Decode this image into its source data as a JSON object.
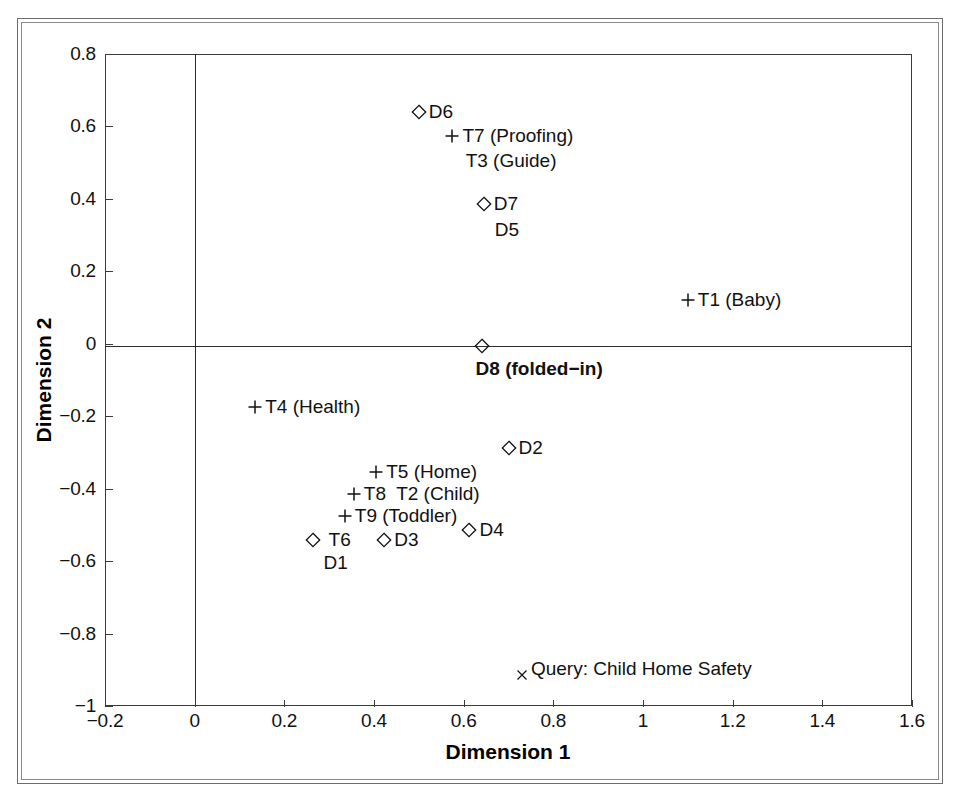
{
  "chart_data": {
    "type": "scatter",
    "title": "",
    "xlabel": "Dimension 1",
    "ylabel": "Dimension 2",
    "xlim": [
      -0.2,
      1.6
    ],
    "ylim": [
      -1.0,
      0.8
    ],
    "xticks": [
      "-0.2",
      "0",
      "0.2",
      "0.4",
      "0.6",
      "0.8",
      "1",
      "1.2",
      "1.4",
      "1.6"
    ],
    "xtickvalues": [
      -0.2,
      0,
      0.2,
      0.4,
      0.6,
      0.8,
      1.0,
      1.2,
      1.4,
      1.6
    ],
    "yticks": [
      "0.8",
      "0.6",
      "0.4",
      "0.2",
      "0",
      "-0.2",
      "-0.4",
      "-0.6",
      "-0.8",
      "-1"
    ],
    "ytickvalues": [
      0.8,
      0.6,
      0.4,
      0.2,
      0,
      -0.2,
      -0.4,
      -0.6,
      -0.8,
      -1.0
    ],
    "grid": false,
    "legend": "none",
    "axes_at_origin": true,
    "marker_kinds": {
      "diamond": "document",
      "plus": "term",
      "cross": "query"
    },
    "points": [
      {
        "id": "p-d6",
        "marker": "diamond",
        "x": 0.5,
        "y": 0.64,
        "label": "D6",
        "label_pos": "right",
        "bold": false
      },
      {
        "id": "p-t7",
        "marker": "plus",
        "x": 0.575,
        "y": 0.575,
        "label": "T7 (Proofing)",
        "label_pos": "right",
        "bold": false
      },
      {
        "id": "p-t3",
        "marker": "none",
        "x": 0.6,
        "y": 0.505,
        "label": "T3 (Guide)",
        "label_pos": "right-plain",
        "bold": false
      },
      {
        "id": "p-d7",
        "marker": "diamond",
        "x": 0.645,
        "y": 0.385,
        "label": "D7",
        "label_pos": "right",
        "bold": false
      },
      {
        "id": "p-d5",
        "marker": "none",
        "x": 0.665,
        "y": 0.315,
        "label": "D5",
        "label_pos": "right-plain",
        "bold": false
      },
      {
        "id": "p-t1",
        "marker": "plus",
        "x": 1.1,
        "y": 0.122,
        "label": "T1 (Baby)",
        "label_pos": "right",
        "bold": false
      },
      {
        "id": "p-d8",
        "marker": "diamond",
        "x": 0.64,
        "y": -0.005,
        "label": "D8 (folded-in)",
        "label_pos": "below",
        "bold": true
      },
      {
        "id": "p-t4",
        "marker": "plus",
        "x": 0.135,
        "y": -0.175,
        "label": "T4 (Health)",
        "label_pos": "right",
        "bold": false
      },
      {
        "id": "p-d2",
        "marker": "diamond",
        "x": 0.7,
        "y": -0.287,
        "label": "D2",
        "label_pos": "right",
        "bold": false
      },
      {
        "id": "p-t5",
        "marker": "plus",
        "x": 0.405,
        "y": -0.355,
        "label": "T5 (Home)",
        "label_pos": "right",
        "bold": false
      },
      {
        "id": "p-t8",
        "marker": "plus",
        "x": 0.355,
        "y": -0.415,
        "label": "T8",
        "label_pos": "right",
        "bold": false
      },
      {
        "id": "p-t2",
        "marker": "none",
        "x": 0.445,
        "y": -0.415,
        "label": "T2 (Child)",
        "label_pos": "right-plain",
        "bold": false
      },
      {
        "id": "p-t9",
        "marker": "plus",
        "x": 0.335,
        "y": -0.475,
        "label": "T9 (Toddler)",
        "label_pos": "right",
        "bold": false
      },
      {
        "id": "p-t6",
        "marker": "diamond",
        "x": 0.263,
        "y": -0.543,
        "label": "T6",
        "label_pos": "right-gap",
        "bold": false
      },
      {
        "id": "p-d1",
        "marker": "none",
        "x": 0.283,
        "y": -0.605,
        "label": "D1",
        "label_pos": "right-plain",
        "bold": false
      },
      {
        "id": "p-d3",
        "marker": "diamond",
        "x": 0.423,
        "y": -0.543,
        "label": "D3",
        "label_pos": "right",
        "bold": false
      },
      {
        "id": "p-d4",
        "marker": "diamond",
        "x": 0.613,
        "y": -0.513,
        "label": "D4",
        "label_pos": "right",
        "bold": false
      },
      {
        "id": "p-query",
        "marker": "cross",
        "x": 0.73,
        "y": -0.915,
        "label": "Query: Child Home Safety",
        "label_pos": "right-up",
        "bold": false
      }
    ]
  },
  "axes": {
    "x_title": "Dimension 1",
    "y_title": "Dimension 2"
  },
  "colors": {
    "ink": "#111111",
    "frame": "#3b3b3b",
    "outer_frame": "#6e6e6e",
    "background": "#ffffff"
  }
}
